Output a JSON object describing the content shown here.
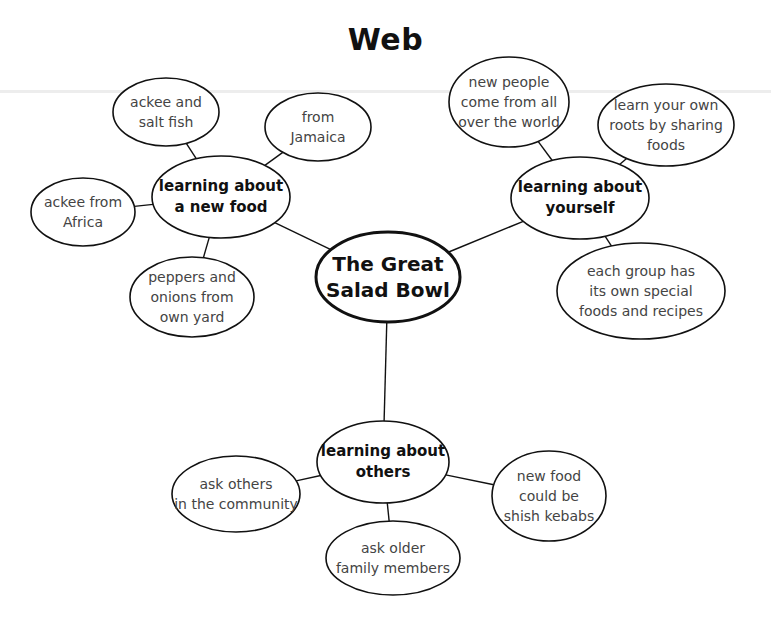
{
  "title": "Web",
  "center": {
    "id": "center",
    "label": "The Great\nSalad Bowl",
    "cx": 388,
    "cy": 277,
    "rx": 72,
    "ry": 45
  },
  "hubs": [
    {
      "id": "hub-new-food",
      "label": "learning about\na new food",
      "cx": 221,
      "cy": 197,
      "rx": 69,
      "ry": 41,
      "leaves": [
        {
          "id": "leaf-ackee-saltfish",
          "label": "ackee and\nsalt fish",
          "cx": 166,
          "cy": 112,
          "rx": 53,
          "ry": 34
        },
        {
          "id": "leaf-from-jamaica",
          "label": "from\nJamaica",
          "cx": 318,
          "cy": 127,
          "rx": 53,
          "ry": 34
        },
        {
          "id": "leaf-ackee-africa",
          "label": "ackee from\nAfrica",
          "cx": 83,
          "cy": 212,
          "rx": 52,
          "ry": 34
        },
        {
          "id": "leaf-peppers-onions",
          "label": "peppers and\nonions from\nown yard",
          "cx": 192,
          "cy": 297,
          "rx": 62,
          "ry": 40
        }
      ]
    },
    {
      "id": "hub-yourself",
      "label": "learning about\nyourself",
      "cx": 580,
      "cy": 198,
      "rx": 69,
      "ry": 41,
      "leaves": [
        {
          "id": "leaf-new-people",
          "label": "new people\ncome from all\nover the world",
          "cx": 509,
          "cy": 102,
          "rx": 60,
          "ry": 45
        },
        {
          "id": "leaf-own-roots",
          "label": "learn your own\nroots by sharing\nfoods",
          "cx": 666,
          "cy": 125,
          "rx": 68,
          "ry": 41
        },
        {
          "id": "leaf-each-group",
          "label": "each group has\nits own special\nfoods and recipes",
          "cx": 641,
          "cy": 291,
          "rx": 84,
          "ry": 48
        }
      ]
    },
    {
      "id": "hub-others",
      "label": "learning about\nothers",
      "cx": 383,
      "cy": 462,
      "rx": 66,
      "ry": 41,
      "leaves": [
        {
          "id": "leaf-ask-community",
          "label": "ask others\nin the community",
          "cx": 236,
          "cy": 494,
          "rx": 64,
          "ry": 38
        },
        {
          "id": "leaf-shish-kebabs",
          "label": "new food\ncould be\nshish kebabs",
          "cx": 549,
          "cy": 496,
          "rx": 57,
          "ry": 45
        },
        {
          "id": "leaf-ask-older",
          "label": "ask older\nfamily members",
          "cx": 393,
          "cy": 558,
          "rx": 67,
          "ry": 37
        }
      ]
    }
  ],
  "style": {
    "stroke_color": "#111111",
    "background": "#ffffff",
    "center_stroke_width": 3,
    "node_stroke_width": 1.6,
    "connector_width": 1.4
  },
  "artifacts": {
    "scan_line_y": 90
  }
}
